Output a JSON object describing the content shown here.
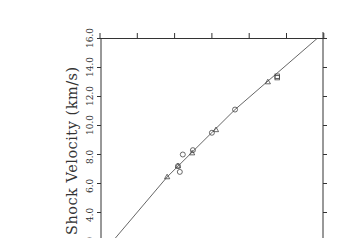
{
  "chart_data": {
    "type": "scatter",
    "title": "",
    "xlabel": "",
    "ylabel": "Shock Velocity (km/s)",
    "y_ticks": [
      "2.0",
      "4.0",
      "6.0",
      "8.0",
      "10.0",
      "12.0",
      "14.0",
      "16.0"
    ],
    "ylim": [
      2.0,
      16.0
    ],
    "x_tick_count": 7,
    "x_tick_labels_visible": false,
    "grid": false,
    "orientation": "rotated 90 degrees (y-axis labels vertical, axis on left)",
    "series": [
      {
        "name": "triangles",
        "marker": "triangle",
        "points": [
          {
            "x_tick": 1.8,
            "y": 6.45
          },
          {
            "x_tick": 2.09,
            "y": 7.2
          },
          {
            "x_tick": 2.47,
            "y": 8.1
          },
          {
            "x_tick": 3.11,
            "y": 9.7
          },
          {
            "x_tick": 4.5,
            "y": 13.0
          }
        ]
      },
      {
        "name": "circles",
        "marker": "circle",
        "points": [
          {
            "x_tick": 2.09,
            "y": 7.2
          },
          {
            "x_tick": 2.14,
            "y": 6.8
          },
          {
            "x_tick": 2.22,
            "y": 8.0
          },
          {
            "x_tick": 2.49,
            "y": 8.3
          },
          {
            "x_tick": 3.0,
            "y": 9.5
          },
          {
            "x_tick": 3.62,
            "y": 11.1
          }
        ]
      },
      {
        "name": "squares",
        "marker": "square",
        "points": [
          {
            "x_tick": 4.75,
            "y": 13.3
          },
          {
            "x_tick": 4.75,
            "y": 13.4
          }
        ]
      },
      {
        "name": "fit curve",
        "marker": "line",
        "points": [
          {
            "x_tick": 0.4,
            "y": 2.2
          },
          {
            "x_tick": 1.8,
            "y": 6.45
          },
          {
            "x_tick": 3.62,
            "y": 11.1
          },
          {
            "x_tick": 5.82,
            "y": 16.0
          }
        ]
      }
    ]
  }
}
